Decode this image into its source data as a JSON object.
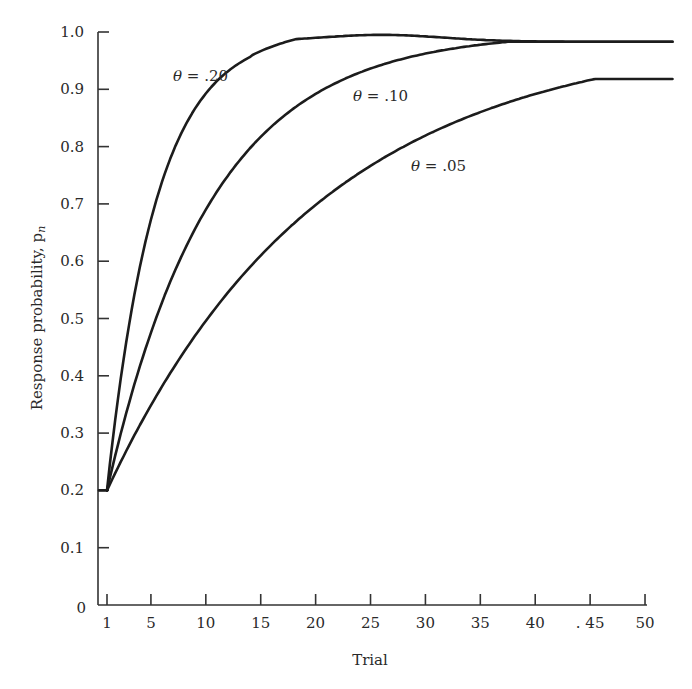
{
  "chart_data": {
    "type": "line",
    "title": "",
    "xlabel": "Trial",
    "ylabel": "Response probability, p",
    "ylabel_subscript": "n",
    "xlim": [
      1,
      52.5
    ],
    "ylim": [
      0,
      1.0
    ],
    "grid": false,
    "legend": "inline labels",
    "x_ticks": [
      1,
      5,
      10,
      15,
      20,
      25,
      30,
      35,
      40,
      45,
      50
    ],
    "x_tick_labels": [
      "1",
      "5",
      "10",
      "15",
      "20",
      "25",
      "30",
      "35",
      "40",
      ". 45",
      "50"
    ],
    "y_ticks": [
      0,
      0.1,
      0.2,
      0.3,
      0.4,
      0.5,
      0.6,
      0.7,
      0.8,
      0.9,
      1.0
    ],
    "y_tick_labels": [
      "0",
      "0.1",
      "0.2",
      "0.3",
      "0.4",
      "0.5",
      "0.6",
      "0.7",
      "0.8",
      "0.9",
      "1.0"
    ],
    "x": [
      1,
      2,
      3,
      4,
      5,
      7,
      10,
      15,
      20,
      25,
      30,
      35,
      40,
      45,
      50,
      52.5
    ],
    "series": [
      {
        "name": "θ = .20",
        "theta": 0.2,
        "label": "θ = .20",
        "values": [
          0.2,
          0.36,
          0.488,
          0.59,
          0.672,
          0.79,
          0.893,
          0.965,
          0.988,
          0.996,
          0.99,
          0.99,
          0.985,
          0.983,
          0.983,
          0.983
        ]
      },
      {
        "name": "θ = .10",
        "theta": 0.1,
        "label": "θ = .10",
        "values": [
          0.2,
          0.28,
          0.352,
          0.417,
          0.475,
          0.575,
          0.69,
          0.817,
          0.892,
          0.936,
          0.962,
          0.978,
          0.983,
          0.983,
          0.983,
          0.983
        ]
      },
      {
        "name": "θ = .05",
        "theta": 0.05,
        "label": "θ = .05",
        "values": [
          0.2,
          0.24,
          0.278,
          0.314,
          0.348,
          0.411,
          0.495,
          0.609,
          0.698,
          0.767,
          0.82,
          0.861,
          0.892,
          0.916,
          0.935,
          0.918
        ]
      }
    ],
    "annotations": [
      {
        "text": "θ = .20",
        "x": 6.0,
        "y": 0.915
      },
      {
        "text": "θ = .10",
        "x": 23.5,
        "y": 0.88
      },
      {
        "text": "θ = .05",
        "x": 28.5,
        "y": 0.765
      }
    ],
    "model": "p_n = 1 - (1 - p_1)(1 - θ)^(n-1), p_1 = 0.2"
  }
}
